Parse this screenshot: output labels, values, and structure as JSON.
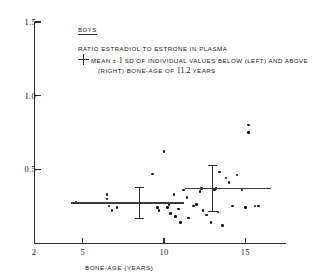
{
  "legend": {
    "group": "BOYS",
    "title": "RATIO ESTRADIOL TO ESTRONE IN PLASMA",
    "line1_a": "MEAN ",
    "line1_pm": "±",
    "line1_one": " 1 ",
    "line1_b": "SD OF INDIVIDUAL VALUES BELOW (LEFT) AND ABOVE",
    "line2_a": "(RIGHT) BONE-AGE OF ",
    "line2_num": "11.2",
    "line2_b": " YEARS",
    "symbol": "error-bar-cross"
  },
  "chart_data": {
    "type": "scatter",
    "title": "RATIO ESTRADIOL TO ESTRONE IN PLASMA",
    "subject_group": "BOYS",
    "xlabel": "BONE-AGE (YEARS)",
    "ylabel": "",
    "xlim": [
      2,
      17.5
    ],
    "ylim": [
      0,
      1.5
    ],
    "xticks": [
      5,
      10,
      15
    ],
    "yticks": [
      0.5,
      1.0,
      1.5
    ],
    "xtick_labels": [
      "5",
      "10",
      "15"
    ],
    "ytick_labels": [
      "0.5",
      "1.0",
      "1.5"
    ],
    "x_origin_label": "2",
    "grid": false,
    "legend_position": "top-center",
    "split_bone_age": 11.2,
    "points": [
      {
        "x": 4.6,
        "y": 0.28
      },
      {
        "x": 6.5,
        "y": 0.33
      },
      {
        "x": 6.5,
        "y": 0.3
      },
      {
        "x": 6.6,
        "y": 0.25
      },
      {
        "x": 6.8,
        "y": 0.22
      },
      {
        "x": 7.1,
        "y": 0.24
      },
      {
        "x": 9.3,
        "y": 0.47
      },
      {
        "x": 9.6,
        "y": 0.24
      },
      {
        "x": 9.7,
        "y": 0.22
      },
      {
        "x": 10.0,
        "y": 0.62
      },
      {
        "x": 10.1,
        "y": 0.27
      },
      {
        "x": 10.2,
        "y": 0.24
      },
      {
        "x": 10.3,
        "y": 0.26
      },
      {
        "x": 10.4,
        "y": 0.2
      },
      {
        "x": 10.6,
        "y": 0.33
      },
      {
        "x": 10.7,
        "y": 0.18
      },
      {
        "x": 10.9,
        "y": 0.23
      },
      {
        "x": 11.0,
        "y": 0.14
      },
      {
        "x": 11.2,
        "y": 0.36
      },
      {
        "x": 11.4,
        "y": 0.31
      },
      {
        "x": 11.5,
        "y": 0.17
      },
      {
        "x": 11.8,
        "y": 0.25
      },
      {
        "x": 12.0,
        "y": 0.26
      },
      {
        "x": 12.2,
        "y": 0.35
      },
      {
        "x": 12.3,
        "y": 0.37
      },
      {
        "x": 12.4,
        "y": 0.22
      },
      {
        "x": 12.6,
        "y": 0.19
      },
      {
        "x": 12.9,
        "y": 0.14
      },
      {
        "x": 13.1,
        "y": 0.36
      },
      {
        "x": 13.2,
        "y": 0.37
      },
      {
        "x": 13.3,
        "y": 0.21
      },
      {
        "x": 13.4,
        "y": 0.48
      },
      {
        "x": 13.6,
        "y": 0.12
      },
      {
        "x": 13.8,
        "y": 0.44
      },
      {
        "x": 14.0,
        "y": 0.41
      },
      {
        "x": 14.2,
        "y": 0.25
      },
      {
        "x": 14.5,
        "y": 0.46
      },
      {
        "x": 14.8,
        "y": 0.36
      },
      {
        "x": 15.0,
        "y": 0.24
      },
      {
        "x": 15.2,
        "y": 0.8
      },
      {
        "x": 15.2,
        "y": 0.75
      },
      {
        "x": 15.6,
        "y": 0.25
      },
      {
        "x": 15.8,
        "y": 0.25
      }
    ],
    "summaries": [
      {
        "label": "below-11.2",
        "x_center": 8.5,
        "x_start": 4.3,
        "x_end": 11.2,
        "mean": 0.27,
        "sd": 0.105
      },
      {
        "label": "above-11.2",
        "x_center": 13.0,
        "x_start": 11.3,
        "x_end": 16.6,
        "mean": 0.37,
        "sd": 0.155
      }
    ]
  }
}
